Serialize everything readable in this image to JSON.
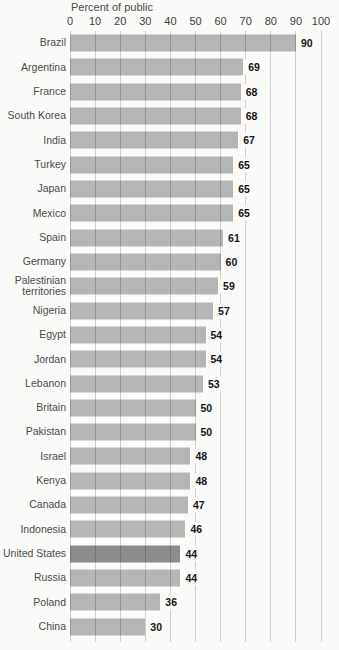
{
  "title": "Percent of public",
  "chart_data": {
    "type": "bar",
    "orientation": "horizontal",
    "title": "Percent of public",
    "categories": [
      "Brazil",
      "Argentina",
      "France",
      "South Korea",
      "India",
      "Turkey",
      "Japan",
      "Mexico",
      "Spain",
      "Germany",
      "Palestinian territories",
      "Nigeria",
      "Egypt",
      "Jordan",
      "Lebanon",
      "Britain",
      "Pakistan",
      "Israel",
      "Kenya",
      "Canada",
      "Indonesia",
      "United States",
      "Russia",
      "Poland",
      "China"
    ],
    "values": [
      90,
      69,
      68,
      68,
      67,
      65,
      65,
      65,
      61,
      60,
      59,
      57,
      54,
      54,
      53,
      50,
      50,
      48,
      48,
      47,
      46,
      44,
      44,
      36,
      30
    ],
    "xlim": [
      0,
      100
    ],
    "x_ticks": [
      0,
      10,
      20,
      30,
      40,
      50,
      60,
      70,
      80,
      90,
      100
    ],
    "grid": true,
    "legend": "none",
    "highlight_category": "United States",
    "colors": {
      "bar": "#b5b5b5",
      "highlight_bar": "#8c8c8c",
      "background": "#fafaf8",
      "category_label": "#4a4a4a",
      "tick_label": "#3d3d3d",
      "value_label": "#141414"
    }
  }
}
